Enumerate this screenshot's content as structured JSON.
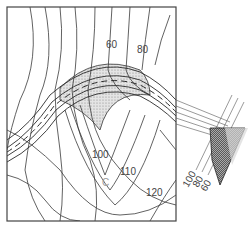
{
  "diagram": {
    "type": "topographic contour map with road grading (cut/fill)",
    "contour_labels": [
      {
        "id": "c60",
        "text": "60"
      },
      {
        "id": "c80",
        "text": "80"
      },
      {
        "id": "c100",
        "text": "100"
      },
      {
        "id": "c110",
        "text": "110"
      },
      {
        "id": "c120",
        "text": "120"
      }
    ],
    "point_label": "C",
    "profile_labels": [
      {
        "id": "p100",
        "text": "100"
      },
      {
        "id": "p80",
        "text": "80"
      },
      {
        "id": "p60",
        "text": "60"
      }
    ],
    "colors": {
      "line": "#3a3a3a",
      "fill_shading": "#cfcfcf",
      "label": "#444444",
      "point_label": "#999999",
      "background": "#ffffff"
    }
  }
}
